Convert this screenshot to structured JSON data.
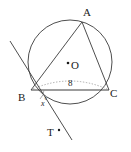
{
  "figure": {
    "type": "geometry-diagram",
    "colors": {
      "stroke": "#3a3a3a",
      "label": "#1a1a1a",
      "background": "#ffffff",
      "dotted_arc": "#8a8a8a"
    }
  },
  "labels": {
    "vertex_a": "A",
    "vertex_b": "B",
    "vertex_c": "C",
    "center_o": "O",
    "point_t": "T",
    "angle_x": "x",
    "degree_symbol": "°",
    "arc_measure": "8"
  },
  "geometry": {
    "circle": {
      "center_x": 70,
      "center_y": 62,
      "radius": 42
    },
    "points": {
      "A": {
        "x": 82,
        "y": 22
      },
      "B": {
        "x": 31,
        "y": 90
      },
      "C": {
        "x": 109,
        "y": 90
      },
      "O": {
        "x": 70,
        "y": 62
      },
      "T": {
        "x": 59,
        "y": 131
      }
    },
    "segments": [
      {
        "name": "chord-AB",
        "from": "A",
        "to": "B"
      },
      {
        "name": "chord-AC",
        "from": "A",
        "to": "C"
      },
      {
        "name": "chord-BC",
        "from": "B",
        "to": "C"
      }
    ],
    "tangent_line": {
      "name": "tangent-through-B",
      "x1": 10,
      "y1": 41,
      "x2": 72,
      "y2": 140
    },
    "dotted_arc": {
      "name": "arc-BC-measure",
      "from": "B",
      "to": "C",
      "label": "8"
    },
    "angle_arc": {
      "name": "angle-x-at-B",
      "vertex": "B",
      "label": "x°"
    }
  }
}
